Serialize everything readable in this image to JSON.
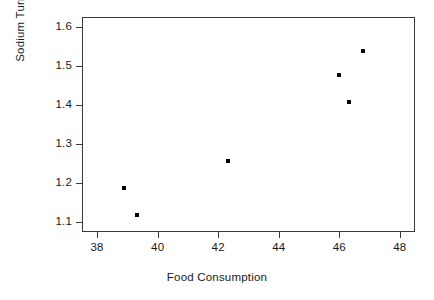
{
  "chart_data": {
    "type": "scatter",
    "title": "",
    "xlabel": "Food Consumption",
    "ylabel": "Sodium Turnover",
    "xlim": [
      37.5,
      48.5
    ],
    "ylim": [
      1.075,
      1.625
    ],
    "grid": false,
    "legend": null,
    "marker": "square-dot",
    "marker_color": "#000000",
    "x_ticks": [
      38,
      40,
      42,
      44,
      46,
      48
    ],
    "y_ticks": [
      1.1,
      1.2,
      1.3,
      1.4,
      1.5,
      1.6
    ],
    "x_tick_labels": [
      "38",
      "40",
      "42",
      "44",
      "46",
      "48"
    ],
    "y_tick_labels": [
      "1.1",
      "1.2",
      "1.3",
      "1.4",
      "1.5",
      "1.6"
    ],
    "points": [
      {
        "x": 38.85,
        "y": 1.19
      },
      {
        "x": 39.3,
        "y": 1.12
      },
      {
        "x": 42.3,
        "y": 1.26
      },
      {
        "x": 45.95,
        "y": 1.48
      },
      {
        "x": 46.3,
        "y": 1.41
      },
      {
        "x": 46.75,
        "y": 1.54
      }
    ]
  },
  "style": {
    "frame_color": "#3a3a3a",
    "background": "#ffffff",
    "text_color": "#1a1a1a"
  }
}
